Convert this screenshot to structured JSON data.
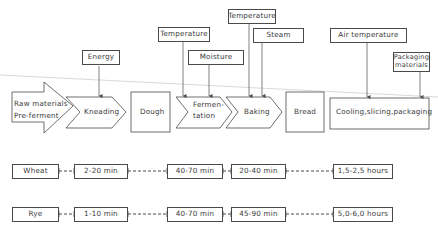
{
  "inputs": {
    "energy": "Energy",
    "temperature_fermentation": "Temperature",
    "moisture": "Moisture",
    "temperature_baking": "Temperature",
    "steam": "Steam",
    "air_temperature": "Air temperature",
    "packaging_materials_line1": "Packaging",
    "packaging_materials_line2": "materials"
  },
  "process": {
    "raw_line1": "Raw materials",
    "raw_line2": "Pre-ferment",
    "kneading": "Kneading",
    "dough": "Dough",
    "fermentation_line1": "Fermen-",
    "fermentation_line2": "tation",
    "baking": "Baking",
    "bread": "Bread",
    "cooling": "Cooling,slicing,packaging"
  },
  "timelines": [
    {
      "grain": "Wheat",
      "kneading": "2-20  min",
      "fermentation": "40-70  min",
      "baking": "20-40  min",
      "cooling": "1,5-2,5  hours"
    },
    {
      "grain": "Rye",
      "kneading": "1-10  min",
      "fermentation": "40-70  min",
      "baking": "45-90  min",
      "cooling": "5,0-6,0  hours"
    }
  ],
  "colors": {
    "line": "#4a4a4a",
    "text": "#3a3a3a",
    "background": "#ffffff"
  }
}
